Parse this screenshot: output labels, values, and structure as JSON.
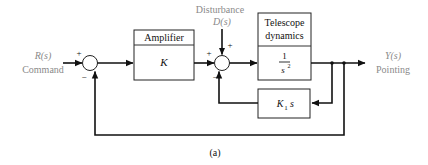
{
  "diagram": {
    "input": {
      "signal": "R(s)",
      "label": "Command"
    },
    "disturbance": {
      "label": "Disturbance",
      "signal": "D(s)"
    },
    "output": {
      "signal": "Y(s)",
      "label": "Pointing"
    },
    "blocks": {
      "amplifier": {
        "title": "Amplifier",
        "gain": "K"
      },
      "telescope": {
        "title_line1": "Telescope",
        "title_line2": "dynamics",
        "tf_num": "1",
        "tf_den": "s",
        "tf_den_exp": "2"
      },
      "feedback": {
        "gain": "K",
        "gain_sub": "1",
        "gain_var": "s"
      }
    },
    "summers": {
      "sum1": {
        "plus": "+",
        "minus": "−"
      },
      "sum2": {
        "plus_left": "+",
        "plus_top": "+",
        "minus": "−"
      }
    },
    "caption": "(a)"
  }
}
